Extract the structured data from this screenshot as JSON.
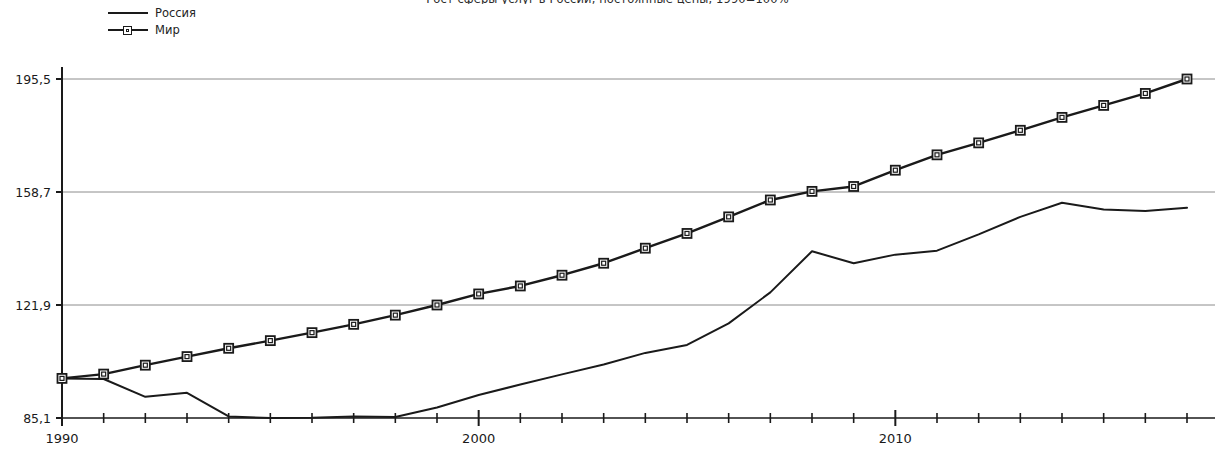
{
  "chart_data": {
    "type": "line",
    "title": "Рост сферы услуг в России, постоянные цены, 1990=100%",
    "xlabel": "",
    "ylabel": "",
    "x": [
      1990,
      1991,
      1992,
      1993,
      1994,
      1995,
      1996,
      1997,
      1998,
      1999,
      2000,
      2001,
      2002,
      2003,
      2004,
      2005,
      2006,
      2007,
      2008,
      2009,
      2010,
      2011,
      2012,
      2013,
      2014,
      2015,
      2016,
      2017
    ],
    "xlim": [
      1990,
      2017
    ],
    "ylim": [
      85.1,
      195.5
    ],
    "y_ticks": [
      85.1,
      121.9,
      158.7,
      195.5
    ],
    "y_tick_labels": [
      "85,1",
      "121,9",
      "158,7",
      "195,5"
    ],
    "x_tick_labels_shown": [
      "1990",
      "2000",
      "2010"
    ],
    "x_ticks_all_years": true,
    "grid": "horizontal",
    "legend_position": "top-left",
    "series": [
      {
        "name": "Россия",
        "marker": "none",
        "color": "#1a1a1a",
        "values": [
          98.0,
          97.8,
          92.0,
          93.3,
          85.6,
          85.1,
          85.2,
          85.6,
          85.4,
          88.5,
          92.6,
          96.0,
          99.3,
          102.5,
          106.3,
          108.9,
          115.9,
          126.0,
          139.4,
          135.5,
          138.3,
          139.6,
          144.9,
          150.6,
          155.2,
          153.0,
          152.5,
          153.6
        ]
      },
      {
        "name": "Мир",
        "marker": "square",
        "color": "#1a1a1a",
        "values": [
          98.0,
          99.4,
          102.3,
          105.1,
          107.8,
          110.3,
          112.9,
          115.6,
          118.6,
          121.9,
          125.5,
          128.1,
          131.6,
          135.5,
          140.4,
          145.2,
          150.6,
          156.1,
          158.9,
          160.5,
          165.8,
          170.8,
          174.7,
          178.8,
          183.0,
          186.9,
          190.8,
          195.5
        ]
      }
    ]
  },
  "legend": {
    "items": [
      {
        "label": "Россия",
        "marker": "none"
      },
      {
        "label": "Мир",
        "marker": "square"
      }
    ]
  },
  "axes": {
    "y_labels": [
      "195,5",
      "158,7",
      "121,9",
      "85,1"
    ],
    "x_labels": [
      {
        "text": "1990",
        "year": 1990
      },
      {
        "text": "2000",
        "year": 2000
      },
      {
        "text": "2010",
        "year": 2010
      }
    ]
  },
  "colors": {
    "line": "#1a1a1a",
    "grid": "#8c8c8c",
    "axis": "#1a1a1a",
    "background": "#ffffff"
  }
}
